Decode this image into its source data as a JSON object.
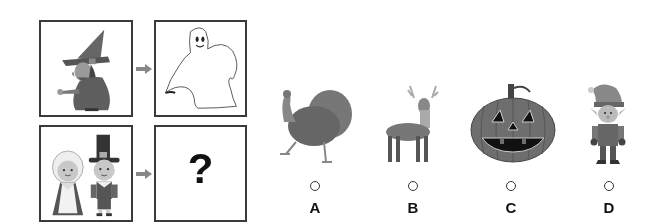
{
  "puzzle": {
    "analogy_top": {
      "left_image": "witch",
      "right_image": "ghost"
    },
    "analogy_bottom": {
      "left_image": "pilgrims",
      "right_placeholder": "?"
    },
    "arrow_icon": "right-arrow-icon"
  },
  "options": [
    {
      "letter": "A",
      "image": "turkey",
      "selected": false
    },
    {
      "letter": "B",
      "image": "deer",
      "selected": false
    },
    {
      "letter": "C",
      "image": "jack-o-lantern",
      "selected": false
    },
    {
      "letter": "D",
      "image": "elf",
      "selected": false
    }
  ]
}
